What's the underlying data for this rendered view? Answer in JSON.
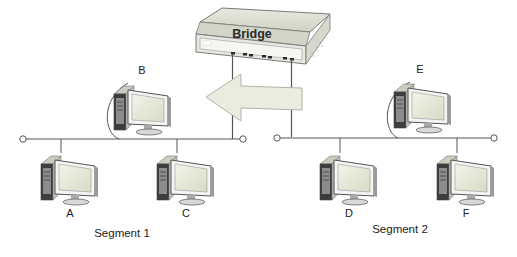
{
  "diagram": {
    "bridge": {
      "label": "Bridge"
    },
    "computers": [
      {
        "id": "A",
        "label": "A",
        "segment": 1
      },
      {
        "id": "B",
        "label": "B",
        "segment": 1
      },
      {
        "id": "C",
        "label": "C",
        "segment": 1
      },
      {
        "id": "D",
        "label": "D",
        "segment": 2
      },
      {
        "id": "E",
        "label": "E",
        "segment": 2
      },
      {
        "id": "F",
        "label": "F",
        "segment": 2
      }
    ],
    "segments": [
      {
        "label": "Segment 1"
      },
      {
        "label": "Segment 2"
      }
    ],
    "arrow": {
      "direction": "left",
      "from": "Segment 2",
      "to": "Segment 1"
    },
    "colors": {
      "line": "#555555",
      "arrow_fill": "#e9ecdf",
      "arrow_stroke": "#b8bcae",
      "bridge_body": "#d9dccf",
      "screen": "#e6ead6"
    }
  }
}
